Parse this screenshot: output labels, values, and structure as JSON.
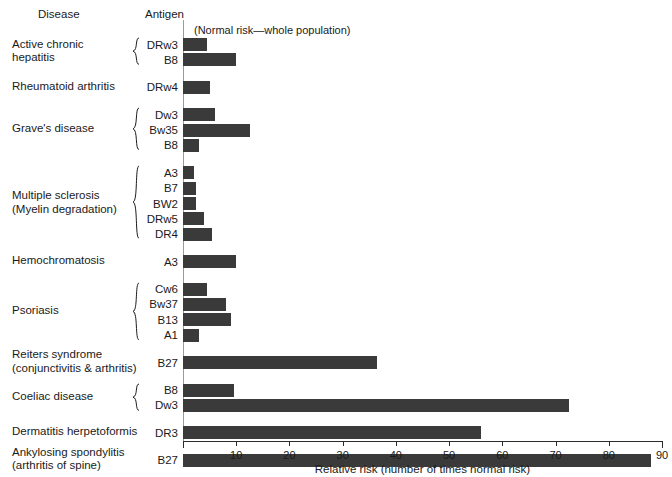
{
  "headers": {
    "disease": "Disease",
    "antigen": "Antigen",
    "note": "(Normal risk—whole population)"
  },
  "axis": {
    "label": "Relative risk (number of times normal risk)",
    "ticks": [
      0,
      10,
      20,
      30,
      40,
      50,
      60,
      70,
      80,
      90
    ],
    "tick_labels": [
      "",
      "10",
      "20",
      "30",
      "40",
      "50",
      "60",
      "70",
      "80",
      "90"
    ],
    "min": 0,
    "max": 90
  },
  "colors": {
    "bar": "#3a3a3a",
    "axis": "#2b2b2b",
    "baseline": "#9a9a9a",
    "text": "#1a1a1a"
  },
  "chart_data": {
    "type": "bar",
    "orientation": "horizontal",
    "title": "",
    "xlabel": "Relative risk (number of times normal risk)",
    "ylabel": "",
    "xlim": [
      0,
      90
    ],
    "grid": false,
    "legend": "none",
    "annotations": [
      "(Normal risk—whole population)"
    ],
    "groups": [
      {
        "disease": "Active chronic\nhepatitis",
        "braced": true,
        "rows": [
          {
            "antigen": "DRw3",
            "value": 4.5
          },
          {
            "antigen": "B8",
            "value": 10.0
          }
        ]
      },
      {
        "disease": "Rheumatoid arthritis",
        "braced": false,
        "rows": [
          {
            "antigen": "DRw4",
            "value": 5.0
          }
        ]
      },
      {
        "disease": "Grave's disease",
        "braced": true,
        "rows": [
          {
            "antigen": "Dw3",
            "value": 6.0
          },
          {
            "antigen": "Bw35",
            "value": 12.5
          },
          {
            "antigen": "B8",
            "value": 3.0
          }
        ]
      },
      {
        "disease": "Multiple sclerosis\n(Myelin degradation)",
        "braced": true,
        "rows": [
          {
            "antigen": "A3",
            "value": 2.0
          },
          {
            "antigen": "B7",
            "value": 2.5
          },
          {
            "antigen": "BW2",
            "value": 2.5
          },
          {
            "antigen": "DRw5",
            "value": 4.0
          },
          {
            "antigen": "DR4",
            "value": 5.5
          }
        ]
      },
      {
        "disease": "Hemochromatosis",
        "braced": false,
        "rows": [
          {
            "antigen": "A3",
            "value": 10.0
          }
        ]
      },
      {
        "disease": "Psoriasis",
        "braced": true,
        "rows": [
          {
            "antigen": "Cw6",
            "value": 4.5
          },
          {
            "antigen": "Bw37",
            "value": 8.0
          },
          {
            "antigen": "B13",
            "value": 9.0
          },
          {
            "antigen": "A1",
            "value": 3.0
          }
        ]
      },
      {
        "disease": "Reiters syndrome\n(conjunctivitis & arthritis)",
        "braced": false,
        "rows": [
          {
            "antigen": "B27",
            "value": 36.5
          }
        ]
      },
      {
        "disease": "Coeliac disease",
        "braced": true,
        "rows": [
          {
            "antigen": "B8",
            "value": 9.5
          },
          {
            "antigen": "Dw3",
            "value": 72.5
          }
        ]
      },
      {
        "disease": "Dermatitis herpetoformis",
        "braced": false,
        "rows": [
          {
            "antigen": "DR3",
            "value": 56.0
          }
        ]
      },
      {
        "disease": "Ankylosing spondylitis\n(arthritis of spine)",
        "braced": false,
        "rows": [
          {
            "antigen": "B27",
            "value": 88.0
          }
        ]
      }
    ]
  }
}
